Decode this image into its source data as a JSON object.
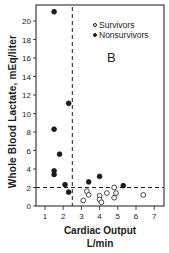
{
  "chart_data": {
    "type": "scatter",
    "title": "",
    "panel_label": "B",
    "xlabel": "Cardiac Output",
    "xlabel_unit": "L/min",
    "ylabel": "Whole Blood Lactate, mEq/liter",
    "xlim": [
      0.5,
      7.5
    ],
    "ylim": [
      0,
      21.5
    ],
    "xticks": [
      1,
      2,
      3,
      4,
      5,
      6,
      7
    ],
    "yticks": [
      0,
      2,
      4,
      6,
      8,
      10,
      12,
      14,
      16,
      18,
      20
    ],
    "grid": false,
    "legend_position": "upper right",
    "reference_lines": [
      {
        "orientation": "vertical",
        "x": 2.5,
        "style": "dashed"
      },
      {
        "orientation": "horizontal",
        "y": 2.0,
        "style": "dashed"
      }
    ],
    "series": [
      {
        "name": "Survivors",
        "marker": "open-circle",
        "points": [
          [
            3.1,
            0.6
          ],
          [
            3.3,
            1.6
          ],
          [
            3.4,
            1.2
          ],
          [
            4.0,
            1.1
          ],
          [
            4.0,
            0.7
          ],
          [
            4.1,
            0.4
          ],
          [
            4.4,
            1.4
          ],
          [
            4.8,
            2.0
          ],
          [
            4.8,
            0.9
          ],
          [
            4.9,
            1.4
          ],
          [
            6.4,
            1.2
          ]
        ]
      },
      {
        "name": "Nonsurvivors",
        "marker": "filled-circle",
        "points": [
          [
            1.5,
            21.0
          ],
          [
            2.3,
            11.1
          ],
          [
            1.5,
            8.3
          ],
          [
            1.8,
            5.6
          ],
          [
            1.5,
            3.8
          ],
          [
            1.5,
            3.4
          ],
          [
            2.1,
            2.3
          ],
          [
            2.3,
            1.5
          ],
          [
            3.4,
            2.6
          ],
          [
            4.0,
            3.2
          ],
          [
            5.3,
            2.2
          ]
        ]
      }
    ]
  },
  "legend": {
    "survivors": "Survivors",
    "nonsurvivors": "Nonsurvivors"
  }
}
